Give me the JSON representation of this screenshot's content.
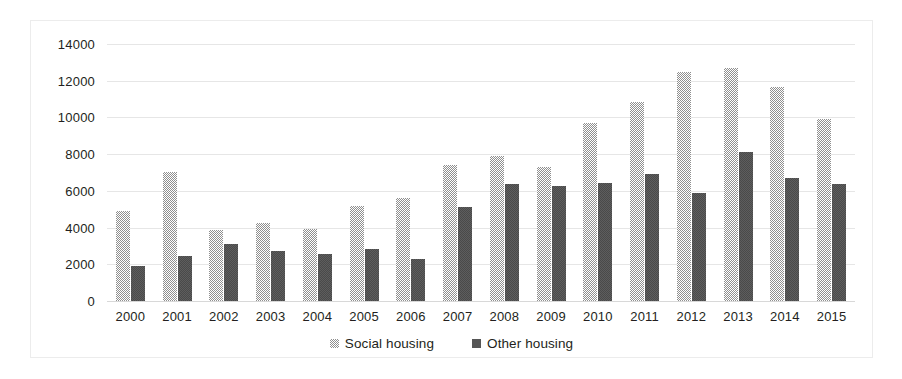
{
  "chart_data": {
    "type": "bar",
    "title": "",
    "subtitle": "",
    "xlabel": "",
    "ylabel": "",
    "ylim": [
      0,
      14000
    ],
    "ytick_step": 2000,
    "yticks": [
      "14000",
      "12000",
      "10000",
      "8000",
      "6000",
      "4000",
      "2000",
      "0"
    ],
    "grid": true,
    "legend_position": "bottom-center",
    "categories": [
      "2000",
      "2001",
      "2002",
      "2003",
      "2004",
      "2005",
      "2006",
      "2007",
      "2008",
      "2009",
      "2010",
      "2011",
      "2012",
      "2013",
      "2014",
      "2015"
    ],
    "series": [
      {
        "name": "Social housing",
        "color": "#8f8f8f",
        "pattern": "checkered",
        "values": [
          4900,
          7050,
          3850,
          4250,
          3950,
          5150,
          5600,
          7400,
          7900,
          7300,
          9700,
          10850,
          12500,
          12700,
          11650,
          9900
        ]
      },
      {
        "name": "Other housing",
        "color": "#565656",
        "pattern": "solid",
        "values": [
          1900,
          2450,
          3100,
          2700,
          2550,
          2850,
          2300,
          5100,
          6400,
          6250,
          6450,
          6900,
          5900,
          8100,
          6700,
          6350
        ]
      }
    ]
  },
  "legend": {
    "items": [
      {
        "label": "Social housing",
        "swatch": "social"
      },
      {
        "label": "Other housing",
        "swatch": "other"
      }
    ]
  },
  "colors": {
    "series_social": "#8f8f8f",
    "series_other": "#565656",
    "gridline": "#e6e6e6",
    "frame_border": "#ececec",
    "text": "#231f20",
    "background": "#ffffff"
  }
}
